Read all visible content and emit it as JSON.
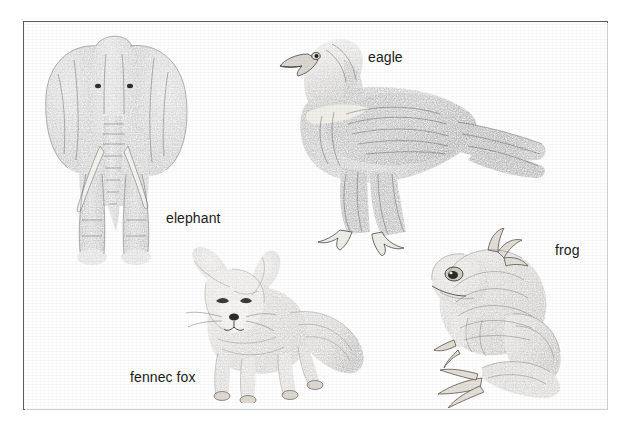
{
  "plate": {
    "title": "Animal illustration plate",
    "medium": "pencil drawing scan",
    "background_color": "#ffffff",
    "frame_color": "#5a5a5e",
    "label_color": "#1b1b1b"
  },
  "figures": [
    {
      "id": "elephant",
      "label": "elephant",
      "icon": "elephant-drawing",
      "description": "front-facing African elephant with large spread ears, tusks and trunk",
      "label_position": {
        "x": 166,
        "y": 211
      }
    },
    {
      "id": "eagle",
      "label": "eagle",
      "icon": "eagle-drawing",
      "description": "golden eagle in left-facing profile, perched, feathered legs and talons",
      "label_position": {
        "x": 368,
        "y": 50
      }
    },
    {
      "id": "fennec-fox",
      "label": "fennec fox",
      "icon": "fennec-fox-drawing",
      "description": "fennec fox standing, oversized ears, bushy tail",
      "label_position": {
        "x": 130,
        "y": 370
      }
    },
    {
      "id": "frog",
      "label": "frog",
      "icon": "frog-drawing",
      "description": "frog in left-facing profile, crouched with folded hind legs and webbed feet",
      "label_position": {
        "x": 555,
        "y": 243
      }
    }
  ]
}
